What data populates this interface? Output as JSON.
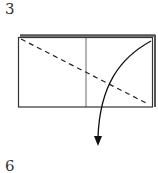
{
  "diagram": {
    "type": "origami-fold-step",
    "step_number_top": "3",
    "step_number_bottom": "6",
    "paper": {
      "front_rect": {
        "x": 18,
        "y": 37,
        "w": 135,
        "h": 70
      },
      "back_layer_top_edge": {
        "x1": 20,
        "y": 36,
        "x2": 155
      },
      "back_layer_right_edge": {
        "x": 155,
        "y1": 36,
        "y2": 107
      },
      "center_crease": {
        "x": 86,
        "y1": 37,
        "y2": 107
      }
    },
    "valley_fold_line": {
      "x1": 21,
      "y1": 39,
      "x2": 148,
      "y2": 104,
      "style": "dashed"
    },
    "fold_arrow": {
      "start": [
        151,
        41
      ],
      "end": [
        98,
        140
      ],
      "direction": "down"
    },
    "colors": {
      "line": "#222222",
      "back_layer": "#555555",
      "background": "#ffffff"
    }
  }
}
